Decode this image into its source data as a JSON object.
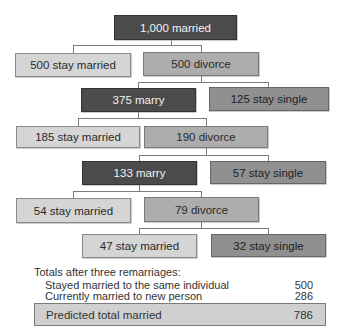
{
  "diagram": {
    "type": "tree",
    "nodes": {
      "root": {
        "label": "1,000 married"
      },
      "l1_stay": {
        "label": "500 stay married"
      },
      "l1_divorce": {
        "label": "500 divorce"
      },
      "l2_marry": {
        "label": "375 marry"
      },
      "l2_single": {
        "label": "125 stay single"
      },
      "l3_stay": {
        "label": "185 stay married"
      },
      "l3_divorce": {
        "label": "190 divorce"
      },
      "l4_marry": {
        "label": "133 marry"
      },
      "l4_single": {
        "label": "57 stay single"
      },
      "l5_stay": {
        "label": "54 stay married"
      },
      "l5_divorce": {
        "label": "79 divorce"
      },
      "l6_stay": {
        "label": "47 stay married"
      },
      "l6_single": {
        "label": "32 stay single"
      }
    },
    "edges": [
      [
        "root",
        "l1_stay"
      ],
      [
        "root",
        "l1_divorce"
      ],
      [
        "l1_divorce",
        "l2_marry"
      ],
      [
        "l1_divorce",
        "l2_single"
      ],
      [
        "l2_marry",
        "l3_stay"
      ],
      [
        "l2_marry",
        "l3_divorce"
      ],
      [
        "l3_divorce",
        "l4_marry"
      ],
      [
        "l3_divorce",
        "l4_single"
      ],
      [
        "l4_marry",
        "l5_stay"
      ],
      [
        "l4_marry",
        "l5_divorce"
      ],
      [
        "l5_divorce",
        "l6_stay"
      ],
      [
        "l5_divorce",
        "l6_single"
      ]
    ],
    "colors": {
      "married": "#4b4b4b",
      "stay_married": "#d5d5d5",
      "divorce": "#adadad",
      "stay_single": "#909090",
      "connector": "#7c7c7c"
    }
  },
  "totals": {
    "title": "Totals after three remarriages:",
    "rows": [
      {
        "label": "Stayed married to the same individual",
        "value": "500"
      },
      {
        "label": "Currently married to new person",
        "value": "286"
      }
    ],
    "total": {
      "label": "Predicted total married",
      "value": "786"
    }
  }
}
